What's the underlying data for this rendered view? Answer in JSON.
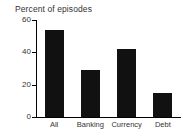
{
  "chart_data": {
    "type": "bar",
    "title": "Percent of episodes",
    "xlabel": "",
    "ylabel": "",
    "categories": [
      "All",
      "Banking",
      "Currency",
      "Debt"
    ],
    "values": [
      54,
      29,
      42,
      15
    ],
    "ylim": [
      0,
      60
    ],
    "yticks": [
      0,
      20,
      40,
      60
    ],
    "ytick_labels": [
      "0",
      "20",
      "40",
      "60"
    ],
    "grid": false,
    "legend": null,
    "bar_color": "#111111",
    "axis_color": "#000000",
    "text_color": "#333333",
    "background": "#ffffff"
  },
  "axis": {
    "y_labels": [
      {
        "text": "60",
        "value": 60
      },
      {
        "text": "40",
        "value": 40
      },
      {
        "text": "20",
        "value": 20
      },
      {
        "text": "0",
        "value": 0
      }
    ]
  },
  "bars": [
    {
      "label": "All",
      "value": 54
    },
    {
      "label": "Banking",
      "value": 29
    },
    {
      "label": "Currency",
      "value": 42
    },
    {
      "label": "Debt",
      "value": 15
    }
  ]
}
